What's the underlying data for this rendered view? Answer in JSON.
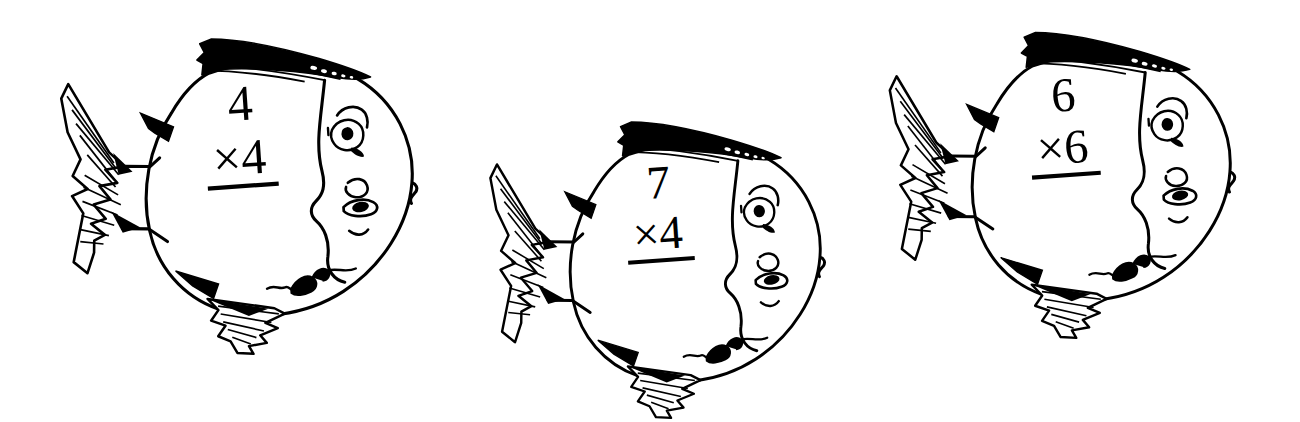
{
  "page": {
    "background_color": "#ffffff",
    "ink_color": "#000000",
    "width": 1300,
    "height": 422,
    "style": "hand-drawn pen-and-ink line art"
  },
  "fish": [
    {
      "id": "fish-1",
      "index": "1",
      "problem": {
        "top_factor": "4",
        "operator": "×",
        "bottom_factor": "4",
        "bottom_line": "×4",
        "answer": ""
      },
      "position": {
        "x": 60,
        "y": 24
      },
      "size": {
        "width": 370,
        "height": 330
      },
      "rotation_deg": -4,
      "parts": [
        "body-oval",
        "tail-fin",
        "dorsal-fin",
        "anal-fin",
        "pectoral-fin",
        "dorsal-spike",
        "ventral-spike",
        "eye",
        "eyebrow",
        "gill-line",
        "nose",
        "lips"
      ]
    },
    {
      "id": "fish-2",
      "index": "2",
      "problem": {
        "top_factor": "7",
        "operator": "×",
        "bottom_factor": "4",
        "bottom_line": "×4",
        "answer": ""
      },
      "position": {
        "x": 478,
        "y": 108
      },
      "size": {
        "width": 370,
        "height": 310
      },
      "rotation_deg": -4,
      "parts": [
        "body-oval",
        "tail-fin",
        "dorsal-fin",
        "anal-fin",
        "pectoral-fin",
        "dorsal-spike",
        "ventral-spike",
        "eye",
        "eyebrow",
        "gill-line",
        "nose",
        "lips"
      ]
    },
    {
      "id": "fish-3",
      "index": "3",
      "problem": {
        "top_factor": "6",
        "operator": "×",
        "bottom_factor": "6",
        "bottom_line": "×6",
        "answer": ""
      },
      "position": {
        "x": 878,
        "y": 18
      },
      "size": {
        "width": 380,
        "height": 320
      },
      "rotation_deg": -4,
      "parts": [
        "body-oval",
        "tail-fin",
        "dorsal-fin",
        "anal-fin",
        "pectoral-fin",
        "dorsal-spike",
        "ventral-spike",
        "eye",
        "eyebrow",
        "gill-line",
        "nose",
        "lips"
      ]
    }
  ]
}
